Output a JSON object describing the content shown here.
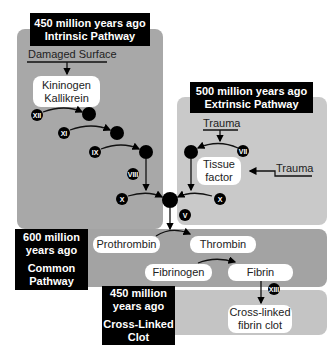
{
  "diagram": {
    "intrinsic": {
      "label_line1": "450 million years ago",
      "label_line2": "Intrinsic Pathway",
      "trigger": "Damaged Surface",
      "cofactor_line1": "Kininogen",
      "cofactor_line2": "Kallikrein",
      "factors": [
        "XII",
        "XI",
        "IX",
        "VIII",
        "X"
      ]
    },
    "extrinsic": {
      "label_line1": "500 million years ago",
      "label_line2": "Extrinsic Pathway",
      "trigger_top": "Trauma",
      "trigger_side": "Trauma",
      "cofactor_line1": "Tissue",
      "cofactor_line2": "factor",
      "factors": [
        "VII",
        "X"
      ]
    },
    "junction_factor": "V",
    "common": {
      "label_line1": "600 million",
      "label_line2": "years ago",
      "label_line3": "Common",
      "label_line4": "Pathway",
      "prothrombin": "Prothrombin",
      "thrombin": "Thrombin",
      "fibrinogen": "Fibrinogen",
      "fibrin": "Fibrin"
    },
    "clot": {
      "label_line1": "450 million",
      "label_line2": "years ago",
      "label_line3": "Cross-Linked",
      "label_line4": "Clot",
      "factor": "XIII",
      "product_line1": "Cross-linked",
      "product_line2": "fibrin clot"
    },
    "colors": {
      "intrinsic_panel": "#a8a8a8",
      "extrinsic_panel": "#c9c9c9",
      "common_panel": "#a3a3a3",
      "clot_panel": "#c4c4c4",
      "label_bg": "#000000",
      "node": "#000000"
    }
  }
}
